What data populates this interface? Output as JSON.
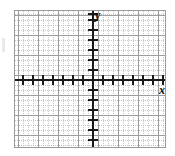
{
  "figure": {
    "kind": "blank-cartesian-coordinate-grid",
    "background_color": "#ffffff",
    "border_color": "#9a9a9a",
    "axis_color": "#1a1a1a",
    "major_grid_color": "#9d9d9d",
    "minor_grid_color": "#b5b5b5"
  },
  "axes": {
    "y_label": "y",
    "x_label": "x",
    "y_axis_name": "y-axis",
    "x_axis_name": "x-axis"
  },
  "chart_data": {
    "type": "scatter",
    "title": "",
    "subtitle": "",
    "xlabel": "x",
    "ylabel": "y",
    "series": [
      {
        "name": "",
        "x": [],
        "y": []
      }
    ],
    "x": [],
    "values": [],
    "categories": [],
    "xlim": [
      -8,
      8
    ],
    "ylim": [
      -7,
      7
    ],
    "xticks": [
      -8,
      -7,
      -6,
      -5,
      -4,
      -3,
      -2,
      -1,
      0,
      1,
      2,
      3,
      4,
      5,
      6,
      7,
      8
    ],
    "yticks": [
      -7,
      -6,
      -5,
      -4,
      -3,
      -2,
      -1,
      0,
      1,
      2,
      3,
      4,
      5,
      6,
      7
    ],
    "xtick_labels": [],
    "ytick_labels": [],
    "tick_spacing_px": 10,
    "major_grid_spacing_px": 20,
    "minor_grid_spacing_px": 5,
    "grid": true,
    "minor_grid": true,
    "legend": false,
    "legend_position": "none",
    "annotations": [],
    "data_labels": []
  }
}
